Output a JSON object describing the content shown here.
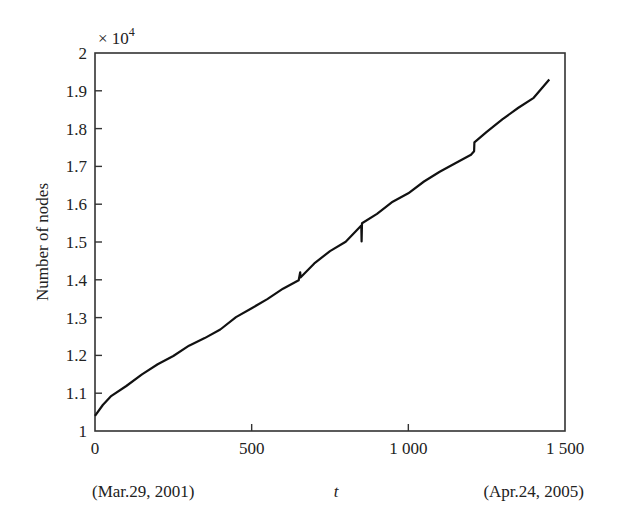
{
  "chart_data": {
    "type": "line",
    "title": "",
    "xlabel": "t",
    "ylabel": "Number of nodes",
    "y_multiplier": "× 10",
    "y_multiplier_exp": "4",
    "xlim": [
      0,
      1500
    ],
    "ylim": [
      1,
      2
    ],
    "x_ticks": [
      0,
      500,
      1000,
      1500
    ],
    "x_tick_labels": [
      "0",
      "500",
      "1 000",
      "1 500"
    ],
    "y_ticks": [
      1,
      1.1,
      1.2,
      1.3,
      1.4,
      1.5,
      1.6,
      1.7,
      1.8,
      1.9,
      2
    ],
    "y_tick_labels": [
      "1",
      "1.1",
      "1.2",
      "1.3",
      "1.4",
      "1.5",
      "1.6",
      "1.7",
      "1.8",
      "1.9",
      "2"
    ],
    "x_annotations": {
      "start": "(Mar.29, 2001)",
      "end": "(Apr.24, 2005)"
    },
    "grid": false,
    "legend": null,
    "series": [
      {
        "name": "Number of nodes (×10^4)",
        "x": [
          0,
          25,
          50,
          100,
          150,
          200,
          250,
          300,
          350,
          400,
          450,
          500,
          550,
          600,
          650,
          655,
          656,
          700,
          750,
          800,
          850,
          851,
          852,
          900,
          950,
          1000,
          1050,
          1100,
          1150,
          1200,
          1210,
          1211,
          1250,
          1300,
          1350,
          1400,
          1450
        ],
        "y": [
          1.04,
          1.07,
          1.09,
          1.12,
          1.15,
          1.175,
          1.2,
          1.225,
          1.245,
          1.27,
          1.3,
          1.325,
          1.35,
          1.375,
          1.4,
          1.42,
          1.405,
          1.445,
          1.475,
          1.5,
          1.545,
          1.5,
          1.55,
          1.575,
          1.605,
          1.63,
          1.66,
          1.685,
          1.71,
          1.73,
          1.74,
          1.765,
          1.79,
          1.825,
          1.855,
          1.88,
          1.93
        ]
      }
    ]
  }
}
